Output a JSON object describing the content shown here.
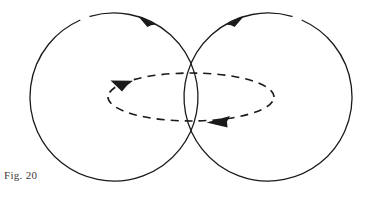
{
  "figure": {
    "caption": "Fig. 20",
    "background_color": "#ffffff",
    "stroke_color": "#1a1a1a",
    "dash_color": "#1a1a1a",
    "caption_color": "#3a3a3a",
    "width": 372,
    "height": 199
  },
  "chart_data": {
    "type": "diagram",
    "title": "Fig. 20",
    "shapes": [
      {
        "name": "left-circle",
        "kind": "circle",
        "cx": 114,
        "cy": 97,
        "r": 84,
        "stroke": "#1a1a1a",
        "stroke_width": 1.3,
        "style": "solid",
        "direction": "counterclockwise",
        "arrow": {
          "name": "left-circle-arrow",
          "angle_deg": 246,
          "tip_x": 141,
          "tip_y": 16,
          "points": "counterclockwise-along-top"
        }
      },
      {
        "name": "right-circle",
        "kind": "circle",
        "cx": 268,
        "cy": 97,
        "r": 84,
        "stroke": "#1a1a1a",
        "stroke_width": 1.3,
        "style": "solid",
        "direction": "clockwise",
        "arrow": {
          "name": "right-circle-arrow",
          "angle_deg": 294,
          "tip_x": 241,
          "tip_y": 16,
          "points": "clockwise-along-top"
        }
      },
      {
        "name": "dashed-ellipse",
        "kind": "ellipse",
        "cx": 191,
        "cy": 97,
        "rx": 83,
        "ry": 24,
        "stroke": "#1a1a1a",
        "stroke_width": 1.6,
        "style": "dashed",
        "dash_pattern": "8 6",
        "direction": "left-along-top-and-bottom",
        "arrows": [
          {
            "name": "ellipse-arrow-top-left",
            "tip_x": 112,
            "tip_y": 82,
            "points": "leftward-along-upper-arc"
          },
          {
            "name": "ellipse-arrow-bottom-right",
            "tip_x": 209,
            "tip_y": 122,
            "points": "leftward-along-lower-arc"
          }
        ]
      }
    ],
    "axis": {
      "visible": false
    },
    "grid": false,
    "legend": {
      "visible": false
    }
  }
}
